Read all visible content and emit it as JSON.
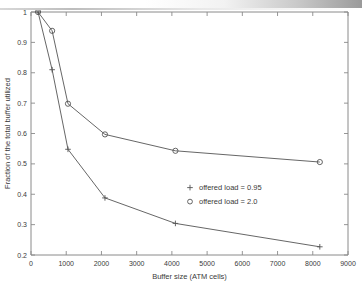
{
  "figure": {
    "background_color": "#ffffff",
    "axis_color": "#8a8a8a",
    "line_color": "#555555",
    "text_color": "#3a3a3a"
  },
  "chart_data": {
    "type": "line",
    "title": "",
    "xlabel": "Buffer size (ATM cells)",
    "ylabel": "Fraction of the total buffer utilized",
    "xlim": [
      0,
      9000
    ],
    "ylim": [
      0.2,
      1.0
    ],
    "xticks": [
      0,
      1000,
      2000,
      3000,
      4000,
      5000,
      6000,
      7000,
      8000,
      9000
    ],
    "xticklabels": [
      "0",
      "1000",
      "2000",
      "3000",
      "4000",
      "5000",
      "6000",
      "7000",
      "8000",
      "9000"
    ],
    "yticks": [
      0.2,
      0.3,
      0.4,
      0.5,
      0.6,
      0.7,
      0.8,
      0.9,
      1.0
    ],
    "yticklabels": [
      "0.2",
      "0.3",
      "0.4",
      "0.5",
      "0.6",
      "0.7",
      "0.8",
      "0.9",
      "1"
    ],
    "grid": false,
    "legend_position": "center-right-inside",
    "series": [
      {
        "name": "offered load = 0.95",
        "marker": "+",
        "x": [
          200,
          600,
          1050,
          2100,
          4100,
          8200
        ],
        "values": [
          1.0,
          0.81,
          0.548,
          0.388,
          0.304,
          0.227
        ]
      },
      {
        "name": "offered load = 2.0",
        "marker": "o",
        "x": [
          200,
          600,
          1050,
          2100,
          4100,
          8200
        ],
        "values": [
          1.0,
          0.938,
          0.698,
          0.597,
          0.543,
          0.506
        ]
      }
    ],
    "legend": [
      {
        "marker": "+",
        "label": "offered load = 0.95"
      },
      {
        "marker": "o",
        "label": "offered load = 2.0"
      }
    ]
  }
}
